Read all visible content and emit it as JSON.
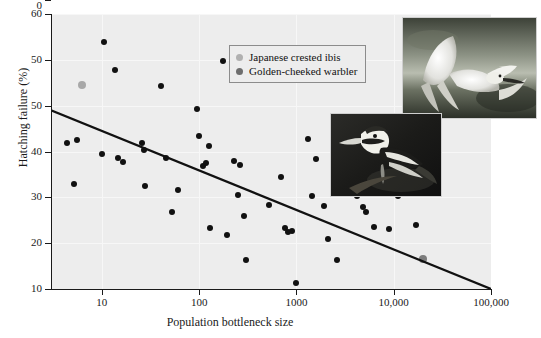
{
  "chart_data": {
    "type": "scatter",
    "title": "",
    "xlabel": "Population bottleneck size",
    "ylabel": "Hatching failure (%)",
    "xscale": "log",
    "xlim": [
      3,
      100000
    ],
    "ylim": [
      0,
      60
    ],
    "grid": true,
    "legend_position": "top-center",
    "xticks": [
      {
        "value": 10,
        "label": "10"
      },
      {
        "value": 100,
        "label": "100"
      },
      {
        "value": 1000,
        "label": "1000"
      },
      {
        "value": 10000,
        "label": "10,000"
      },
      {
        "value": 100000,
        "label": "100,000"
      }
    ],
    "yticks": [
      {
        "value": 60,
        "label": "60"
      },
      {
        "value": 50,
        "label": "50"
      },
      {
        "value": 40,
        "label": "50"
      },
      {
        "value": 30,
        "label": "40"
      },
      {
        "value": 20,
        "label": "30"
      },
      {
        "value": 10,
        "label": "20"
      },
      {
        "value": 5,
        "label": "10"
      },
      {
        "value": 0,
        "label": "0"
      }
    ],
    "ytick_values_plotted": [
      60,
      50,
      40,
      30,
      20,
      10,
      0
    ],
    "series": [
      {
        "name": "Other species",
        "color": "#111111",
        "points": [
          {
            "x": 4.4,
            "y": 31.8
          },
          {
            "x": 5.6,
            "y": 32.6
          },
          {
            "x": 5.2,
            "y": 23.0
          },
          {
            "x": 10.5,
            "y": 54.0
          },
          {
            "x": 10.0,
            "y": 29.4
          },
          {
            "x": 13.5,
            "y": 47.8
          },
          {
            "x": 14.5,
            "y": 28.6
          },
          {
            "x": 16.5,
            "y": 27.8
          },
          {
            "x": 26.0,
            "y": 31.9
          },
          {
            "x": 27.0,
            "y": 30.4
          },
          {
            "x": 28.0,
            "y": 22.5
          },
          {
            "x": 41.0,
            "y": 44.2
          },
          {
            "x": 46.0,
            "y": 28.6
          },
          {
            "x": 52.0,
            "y": 16.8
          },
          {
            "x": 60.0,
            "y": 21.7
          },
          {
            "x": 95.0,
            "y": 39.3
          },
          {
            "x": 100.0,
            "y": 33.4
          },
          {
            "x": 110.0,
            "y": 26.9
          },
          {
            "x": 118.0,
            "y": 27.5
          },
          {
            "x": 125.0,
            "y": 31.3
          },
          {
            "x": 130.0,
            "y": 13.4
          },
          {
            "x": 175.0,
            "y": 49.7
          },
          {
            "x": 195.0,
            "y": 11.8
          },
          {
            "x": 230.0,
            "y": 28.0
          },
          {
            "x": 250.0,
            "y": 20.6
          },
          {
            "x": 265.0,
            "y": 27.0
          },
          {
            "x": 290.0,
            "y": 15.9
          },
          {
            "x": 300.0,
            "y": 6.3
          },
          {
            "x": 520.0,
            "y": 18.4
          },
          {
            "x": 700.0,
            "y": 24.4
          },
          {
            "x": 760.0,
            "y": 13.3
          },
          {
            "x": 820.0,
            "y": 12.4
          },
          {
            "x": 900.0,
            "y": 12.6
          },
          {
            "x": 980.0,
            "y": 1.3
          },
          {
            "x": 1300.0,
            "y": 32.8
          },
          {
            "x": 1450.0,
            "y": 20.4
          },
          {
            "x": 1600.0,
            "y": 28.4
          },
          {
            "x": 1900.0,
            "y": 18.1
          },
          {
            "x": 2100.0,
            "y": 10.9
          },
          {
            "x": 2600.0,
            "y": 6.4
          },
          {
            "x": 3300.0,
            "y": 22.9
          },
          {
            "x": 4200.0,
            "y": 20.3
          },
          {
            "x": 4800.0,
            "y": 18.0
          },
          {
            "x": 5200.0,
            "y": 16.8
          },
          {
            "x": 6200.0,
            "y": 13.5
          },
          {
            "x": 9000.0,
            "y": 13.0
          },
          {
            "x": 11000.0,
            "y": 20.2
          },
          {
            "x": 17000.0,
            "y": 13.9
          }
        ]
      },
      {
        "name": "Japanese crested ibis",
        "color": "#a8a8a8",
        "points": [
          {
            "x": 6.2,
            "y": 44.5
          }
        ]
      },
      {
        "name": "Golden-cheeked warbler",
        "color": "#7d7d7d",
        "points": [
          {
            "x": 20000.0,
            "y": 6.5
          }
        ]
      }
    ],
    "trendline": {
      "type": "linear-on-log-x",
      "start": {
        "x": 3,
        "y": 39.0
      },
      "end": {
        "x": 100000,
        "y": 0.0
      },
      "color": "#111111"
    },
    "annotations": [
      {
        "name": "ibis-photo",
        "description": "Japanese crested ibis in flight"
      },
      {
        "name": "warbler-photo",
        "description": "Golden-cheeked warbler perched on a branch"
      }
    ]
  },
  "legend": {
    "items": [
      {
        "label": "Japanese crested ibis",
        "color": "#b0b0b0"
      },
      {
        "label": "Golden-cheeked warbler",
        "color": "#6e6e6e"
      }
    ]
  }
}
